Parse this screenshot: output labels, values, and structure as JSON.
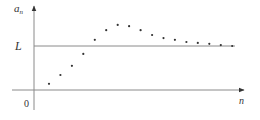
{
  "chart_data": {
    "type": "scatter",
    "title": "",
    "xlabel": "n",
    "ylabel": "a",
    "ylabel_subscript": "n",
    "origin_label": "0",
    "reference_line": {
      "label": "L",
      "value": 1.0
    },
    "x": [
      1,
      2,
      3,
      4,
      5,
      6,
      7,
      8,
      9,
      10,
      11,
      12,
      13,
      14,
      15,
      16,
      17
    ],
    "series": [
      {
        "name": "a_n",
        "values": [
          0.14,
          0.34,
          0.55,
          0.82,
          1.14,
          1.36,
          1.48,
          1.45,
          1.36,
          1.25,
          1.18,
          1.14,
          1.09,
          1.07,
          1.05,
          1.02,
          1.0
        ]
      }
    ],
    "xlim": [
      0,
      18
    ],
    "ylim": [
      -0.4,
      1.9
    ],
    "grid": false,
    "legend": "none",
    "tick_labels": []
  },
  "colors": {
    "axis": "#8a8a8a",
    "points": "#333333",
    "text": "#333333"
  }
}
